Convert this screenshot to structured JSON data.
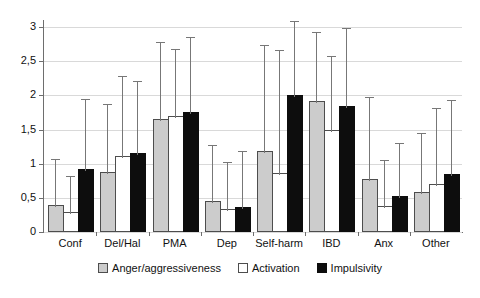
{
  "chart_data": {
    "type": "bar",
    "title": "",
    "subtitle": "",
    "xlabel": "",
    "ylabel": "",
    "categories": [
      "Conf",
      "Del/Hal",
      "PMA",
      "Dep",
      "Self-harm",
      "IBD",
      "Anx",
      "Other"
    ],
    "series": [
      {
        "name": "Anger/aggressiveness",
        "color": "#cccccc",
        "values": [
          0.37,
          0.85,
          1.63,
          0.43,
          1.15,
          1.89,
          0.74,
          0.55
        ],
        "error_upper": [
          1.07,
          1.88,
          2.78,
          1.27,
          2.73,
          2.92,
          1.98,
          1.45
        ]
      },
      {
        "name": "Activation",
        "color": "#ffffff",
        "values": [
          0.27,
          1.09,
          1.67,
          0.31,
          0.83,
          1.46,
          0.35,
          0.67
        ],
        "error_upper": [
          0.82,
          2.28,
          2.68,
          1.02,
          2.67,
          2.58,
          1.06,
          1.82
        ]
      },
      {
        "name": "Impulsivity",
        "color": "#0d0d0d",
        "values": [
          0.9,
          1.13,
          1.73,
          0.33,
          1.97,
          1.82,
          0.5,
          0.82
        ],
        "error_upper": [
          1.95,
          2.21,
          2.85,
          1.18,
          3.12,
          2.98,
          1.3,
          1.93
        ]
      }
    ],
    "ylim": [
      0,
      3.05
    ],
    "yticks": [
      0,
      0.5,
      1,
      1.5,
      2,
      2.5,
      3
    ],
    "ytick_labels": [
      "0",
      "0,5",
      "1",
      "1,5",
      "2",
      "2,5",
      "3"
    ],
    "grid": true,
    "legend_position": "bottom",
    "decimal_separator": ","
  }
}
